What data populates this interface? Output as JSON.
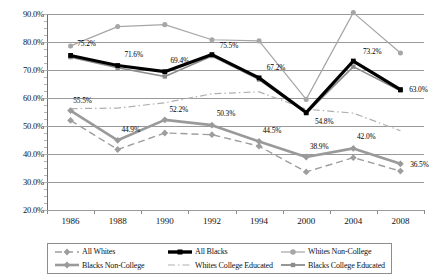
{
  "chart_data": {
    "type": "line",
    "title": "",
    "xlabel": "",
    "ylabel": "",
    "categories": [
      "1986",
      "1988",
      "1990",
      "1992",
      "1994",
      "2000",
      "2004",
      "2008"
    ],
    "ylim": [
      20,
      90
    ],
    "ytick_labels": [
      "20.0%",
      "30.0%",
      "40.0%",
      "50.0%",
      "60.0%",
      "70.0%",
      "80.0%",
      "90.0%"
    ],
    "ytick_values": [
      20,
      30,
      40,
      50,
      60,
      70,
      80,
      90
    ],
    "grid": true,
    "legend_position": "bottom",
    "series": [
      {
        "name": "All Whites",
        "color": "#9e9e9e",
        "style": "dashed",
        "marker": "diamond",
        "width": 1.4,
        "values": [
          52.0,
          41.6,
          47.5,
          46.9,
          42.8,
          33.6,
          38.7,
          33.9
        ]
      },
      {
        "name": "All Blacks",
        "color": "#000000",
        "style": "solid",
        "marker": "square",
        "width": 3.2,
        "values": [
          75.2,
          71.6,
          69.4,
          75.5,
          67.2,
          54.8,
          73.2,
          63.0
        ]
      },
      {
        "name": "Whites Non-College",
        "color": "#a6a6a6",
        "style": "solid",
        "marker": "circle",
        "width": 1.2,
        "values": [
          78.6,
          85.5,
          86.2,
          80.8,
          80.4,
          59.5,
          90.5,
          76.1
        ]
      },
      {
        "name": "Blacks Non-College",
        "color": "#9a9a9a",
        "style": "solid",
        "marker": "diamond",
        "width": 2.6,
        "values": [
          55.5,
          44.9,
          52.2,
          50.3,
          44.5,
          38.9,
          42.0,
          36.5
        ]
      },
      {
        "name": "Whites College Educated",
        "color": "#b0b0b0",
        "style": "dashdot",
        "marker": "none",
        "width": 1.2,
        "values": [
          56.2,
          56.4,
          58.3,
          61.5,
          62.2,
          56.0,
          54.6,
          48.3
        ]
      },
      {
        "name": "Blacks College Educated",
        "color": "#8c8c8c",
        "style": "solid",
        "marker": "square",
        "width": 1.6,
        "values": [
          74.6,
          70.8,
          67.7,
          75.0,
          66.6,
          54.5,
          71.2,
          62.6
        ]
      }
    ],
    "point_labels": [
      {
        "text": "75.2%",
        "series": "All Blacks",
        "index": 0,
        "dx": 16,
        "dy": -11
      },
      {
        "text": "71.6%",
        "series": "All Blacks",
        "index": 1,
        "dx": 16,
        "dy": -11
      },
      {
        "text": "69.4%",
        "series": "All Blacks",
        "index": 2,
        "dx": 15,
        "dy": -11
      },
      {
        "text": "75.5%",
        "series": "All Blacks",
        "index": 3,
        "dx": 17,
        "dy": -9
      },
      {
        "text": "67.2%",
        "series": "All Blacks",
        "index": 4,
        "dx": 17,
        "dy": -10
      },
      {
        "text": "54.8%",
        "series": "All Blacks",
        "index": 5,
        "dx": 18,
        "dy": 9
      },
      {
        "text": "73.2%",
        "series": "All Blacks",
        "index": 6,
        "dx": 19,
        "dy": -9
      },
      {
        "text": "63.0%",
        "series": "All Blacks",
        "index": 7,
        "dx": 18,
        "dy": 0
      },
      {
        "text": "55.5%",
        "series": "Blacks Non-College",
        "index": 0,
        "dx": 12,
        "dy": -10
      },
      {
        "text": "44.9%",
        "series": "Blacks Non-College",
        "index": 1,
        "dx": 13,
        "dy": -10
      },
      {
        "text": "52.2%",
        "series": "Blacks Non-College",
        "index": 2,
        "dx": 14,
        "dy": -10
      },
      {
        "text": "50.3%",
        "series": "Blacks Non-College",
        "index": 3,
        "dx": 14,
        "dy": -11
      },
      {
        "text": "44.5%",
        "series": "Blacks Non-College",
        "index": 4,
        "dx": 13,
        "dy": -10
      },
      {
        "text": "38.9%",
        "series": "Blacks Non-College",
        "index": 5,
        "dx": 13,
        "dy": -10
      },
      {
        "text": "42.0%",
        "series": "Blacks Non-College",
        "index": 6,
        "dx": 13,
        "dy": -11
      },
      {
        "text": "36.5%",
        "series": "Blacks Non-College",
        "index": 7,
        "dx": 19,
        "dy": 1
      }
    ],
    "legend": [
      {
        "label": "All Whites",
        "color": "#9e9e9e",
        "style": "dashed",
        "marker": "diamond",
        "width": 1.6
      },
      {
        "label": "All Blacks",
        "color": "#000000",
        "style": "solid",
        "marker": "square",
        "width": 3.4
      },
      {
        "label": "Whites Non-College",
        "color": "#a6a6a6",
        "style": "solid",
        "marker": "circle",
        "width": 1.2
      },
      {
        "label": "Blacks Non-College",
        "color": "#9a9a9a",
        "style": "solid",
        "marker": "diamond",
        "width": 2.6
      },
      {
        "label": "Whites College Educated",
        "color": "#b0b0b0",
        "style": "dashdot",
        "marker": "none",
        "width": 1.2
      },
      {
        "label": "Blacks College Educated",
        "color": "#8c8c8c",
        "style": "solid",
        "marker": "square",
        "width": 1.8
      }
    ]
  }
}
